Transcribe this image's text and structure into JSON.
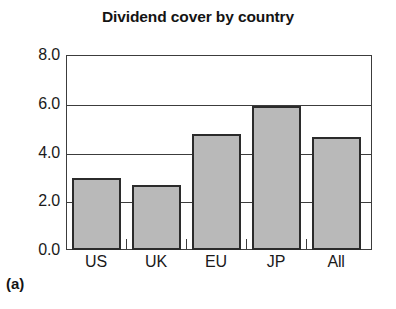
{
  "chart_data": {
    "type": "bar",
    "title": "Dividend cover by country",
    "xlabel": "",
    "ylabel": "",
    "categories": [
      "US",
      "UK",
      "EU",
      "JP",
      "All"
    ],
    "values": [
      2.95,
      2.65,
      4.75,
      5.9,
      4.65
    ],
    "ylim": [
      0.0,
      8.0
    ],
    "y_ticks": [
      "0.0",
      "2.0",
      "4.0",
      "6.0",
      "8.0"
    ],
    "y_tick_values": [
      0.0,
      2.0,
      4.0,
      6.0,
      8.0
    ],
    "grid": true,
    "legend": null,
    "series": [
      {
        "name": "Dividend cover",
        "values": [
          2.95,
          2.65,
          4.75,
          5.9,
          4.65
        ]
      }
    ],
    "bar_fill_color": "#b9b9b9",
    "bar_edge_color": "#2b2b2b",
    "axis_color": "#3c3c3c"
  },
  "figure": {
    "panel_label": "(a)"
  }
}
